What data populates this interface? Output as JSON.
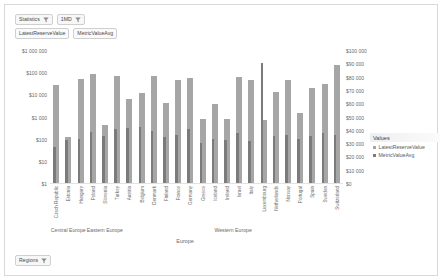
{
  "toolbar": {
    "statistics_pill": "Statistics",
    "period_pill": "1MD",
    "measure_pill_1": "LatestReserveValue",
    "measure_pill_2": "MetricValueAvg",
    "filter_icon": "funnel-filter-icon"
  },
  "footer": {
    "regions_pill": "Regions",
    "filter_icon": "funnel-filter-icon"
  },
  "legend": {
    "title": "Values",
    "items": [
      {
        "label": "LatestReserveValue",
        "color": "#a6a6a6"
      },
      {
        "label": "MetricValueAvg",
        "color": "#7b7b7b"
      }
    ]
  },
  "chart_data": {
    "type": "bar",
    "title": "",
    "xlabel": "Europe",
    "ylabel": "",
    "grid": false,
    "legend_position": "right",
    "y_left_scale": "log",
    "y_left_ticks": [
      "$1 000 000",
      "$100 000",
      "$10 000",
      "$1 000",
      "$100",
      "$10",
      "$1"
    ],
    "y_left_lim": [
      1,
      1000000
    ],
    "y_right_scale": "linear",
    "y_right_ticks": [
      "$100 000",
      "$90 000",
      "$80 000",
      "$70 000",
      "$60 000",
      "$50 000",
      "$40 000",
      "$30 000",
      "$20 000",
      "$10 000",
      "$0"
    ],
    "y_right_lim": [
      0,
      100000
    ],
    "groups": [
      {
        "label": "Central Europe",
        "span": 3
      },
      {
        "label": "Eastern Europe",
        "span": 3
      },
      {
        "label": "Western Europe",
        "span": 18
      }
    ],
    "categories": [
      "Czech Republic",
      "Estonia",
      "Hungary",
      "Poland",
      "Slovenia",
      "Turkey",
      "Austria",
      "Belgium",
      "Denmark",
      "Finland",
      "France",
      "Germany",
      "Greece",
      "Iceland",
      "Ireland",
      "Israel",
      "Italy",
      "Luxembourg",
      "Netherlands",
      "Norway",
      "Portugal",
      "Spain",
      "Sweden",
      "Switzerland"
    ],
    "series": [
      {
        "name": "LatestReserveValue",
        "color": "#a6a6a6",
        "axis": "left",
        "values": [
          28000,
          130,
          52000,
          90000,
          480,
          78000,
          6500,
          13000,
          78000,
          4600,
          48000,
          62000,
          820,
          4200,
          880,
          67000,
          50000,
          760,
          14000,
          50000,
          1600,
          22000,
          34000,
          230000
        ]
      },
      {
        "name": "MetricValueAvg",
        "color": "#7b7b7b",
        "axis": "right",
        "values": [
          28000,
          33000,
          34000,
          39000,
          36000,
          41000,
          42000,
          43000,
          40000,
          35000,
          37000,
          41000,
          31000,
          34000,
          33000,
          38000,
          32000,
          91000,
          36000,
          37000,
          34000,
          36000,
          38000,
          37000
        ]
      }
    ]
  }
}
